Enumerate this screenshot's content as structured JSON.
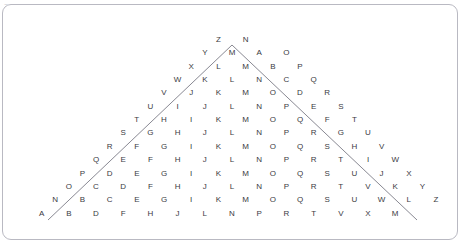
{
  "top_clip": {
    "text": "▫▫  ▫▫▫  ▫▫▫▫  ▫▫"
  },
  "puzzle": {
    "title": "",
    "colors": {
      "letter": "#3a3a42",
      "card_border": "#b9b9c2",
      "vee_line": "#7a7a86",
      "background": "#ffffff"
    },
    "layout": {
      "col_spacing": 27.2,
      "row_spacing": 13.35,
      "center_x": 232,
      "first_row_y": 36,
      "row_count": 14
    },
    "overlay": {
      "shape": "vee",
      "apex": {
        "x": 232,
        "y": 45
      },
      "left_end": {
        "x": 48,
        "y": 220
      },
      "right_end": {
        "x": 417,
        "y": 220
      }
    },
    "rows": [
      {
        "index": 0,
        "offset": -0.5,
        "letters": [
          "Z",
          "N"
        ]
      },
      {
        "index": 1,
        "offset": -1.0,
        "letters": [
          "Y",
          "M",
          "A",
          "O"
        ]
      },
      {
        "index": 2,
        "offset": -1.5,
        "letters": [
          "X",
          "L",
          "M",
          "B",
          "P"
        ]
      },
      {
        "index": 3,
        "offset": -2.0,
        "letters": [
          "W",
          "K",
          "L",
          "N",
          "C",
          "Q"
        ]
      },
      {
        "index": 4,
        "offset": -2.5,
        "letters": [
          "V",
          "J",
          "K",
          "M",
          "O",
          "D",
          "R"
        ]
      },
      {
        "index": 5,
        "offset": -3.0,
        "letters": [
          "U",
          "I",
          "J",
          "L",
          "N",
          "P",
          "E",
          "S"
        ]
      },
      {
        "index": 6,
        "offset": -3.5,
        "letters": [
          "T",
          "H",
          "I",
          "K",
          "M",
          "O",
          "Q",
          "F",
          "T"
        ]
      },
      {
        "index": 7,
        "offset": -4.0,
        "letters": [
          "S",
          "G",
          "H",
          "J",
          "L",
          "N",
          "P",
          "R",
          "G",
          "U"
        ]
      },
      {
        "index": 8,
        "offset": -4.5,
        "letters": [
          "R",
          "F",
          "G",
          "I",
          "K",
          "M",
          "O",
          "Q",
          "S",
          "H",
          "V"
        ]
      },
      {
        "index": 9,
        "offset": -5.0,
        "letters": [
          "Q",
          "E",
          "F",
          "H",
          "J",
          "L",
          "N",
          "P",
          "R",
          "T",
          "I",
          "W"
        ]
      },
      {
        "index": 10,
        "offset": -5.5,
        "letters": [
          "P",
          "D",
          "E",
          "G",
          "I",
          "K",
          "M",
          "O",
          "Q",
          "S",
          "U",
          "J",
          "X"
        ]
      },
      {
        "index": 11,
        "offset": -6.0,
        "letters": [
          "O",
          "C",
          "D",
          "F",
          "H",
          "J",
          "L",
          "N",
          "P",
          "R",
          "T",
          "V",
          "K",
          "Y"
        ]
      },
      {
        "index": 12,
        "offset": -6.5,
        "letters": [
          "N",
          "B",
          "C",
          "E",
          "G",
          "I",
          "K",
          "M",
          "O",
          "Q",
          "S",
          "U",
          "W",
          "L",
          "Z"
        ]
      },
      {
        "index": 13,
        "offset": -7.0,
        "letters": [
          "A",
          "B",
          "D",
          "F",
          "H",
          "J",
          "L",
          "N",
          "P",
          "R",
          "T",
          "V",
          "X",
          "M"
        ]
      }
    ]
  }
}
